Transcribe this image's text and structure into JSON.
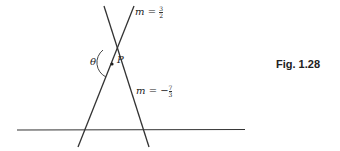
{
  "figure": {
    "caption": "Fig. 1.28",
    "point_label": "P",
    "angle_label": "θ",
    "line1": {
      "label_prefix": "m = ",
      "sign": "",
      "num": "3",
      "den": "2"
    },
    "line2": {
      "label_prefix": "m = ",
      "sign": "−",
      "num": "7",
      "den": "3"
    },
    "colors": {
      "stroke": "#333333",
      "background": "#ffffff"
    }
  }
}
